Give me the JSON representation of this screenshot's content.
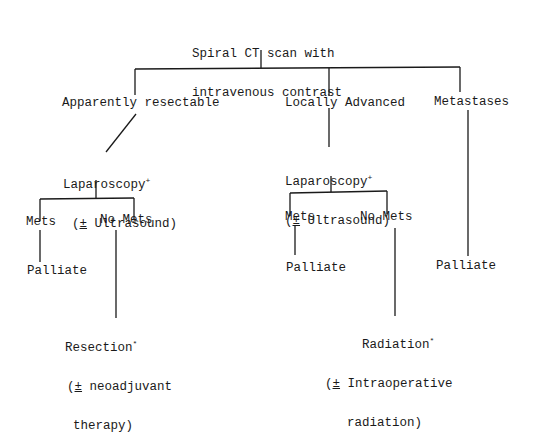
{
  "diagram": {
    "type": "flowchart",
    "root": {
      "line1": "Spiral CT scan with",
      "line2": "intravenous contrast"
    },
    "branches": {
      "resectable": {
        "label": "Apparently resectable",
        "procedure": {
          "line1": "Laparoscopy",
          "mark": "+",
          "line2_pm": "±",
          "line2_rest": " Ultrasound)",
          "line2_open": "("
        },
        "mets": {
          "label": "Mets",
          "outcome": "Palliate"
        },
        "no_mets": {
          "label": "No Mets",
          "outcome": {
            "line1": "Resection",
            "mark": "*",
            "line2_open": "(",
            "line2_pm": "±",
            "line2_rest": " neoadjuvant",
            "line3": "therapy)"
          }
        }
      },
      "locally_advanced": {
        "label": "Locally Advanced",
        "procedure": {
          "line1": "Laparoscopy",
          "mark": "+",
          "line2_pm": "±",
          "line2_rest": " Ultrasound)",
          "line2_open": "("
        },
        "mets": {
          "label": "Mets",
          "outcome": "Palliate"
        },
        "no_mets": {
          "label": "No Mets",
          "outcome": {
            "line1": "Radiation",
            "mark": "*",
            "line2_open": "(",
            "line2_pm": "±",
            "line2_rest": " Intraoperative",
            "line3": "radiation)"
          }
        }
      },
      "metastases": {
        "label": "Metastases",
        "outcome": "Palliate"
      }
    }
  }
}
